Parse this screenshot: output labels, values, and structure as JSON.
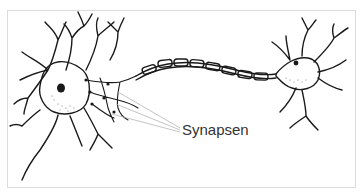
{
  "diagram": {
    "labels": {
      "synapses": "Synapsen"
    },
    "colors": {
      "outline": "#1a1a1a",
      "pointer_line": "#b5b5b5",
      "frame": "#dcdcdc",
      "label": "#333333",
      "soma_dots": "#777777"
    }
  }
}
